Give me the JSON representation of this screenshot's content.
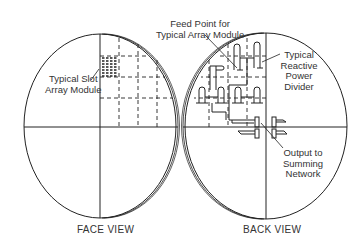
{
  "figure": {
    "face_view": {
      "caption": "FACE VIEW",
      "callout_slot_module": [
        "Typical Slot",
        "Array Module"
      ]
    },
    "back_view": {
      "caption": "BACK VIEW",
      "callout_feed_point": [
        "Feed Point for",
        "Typical Array Module"
      ],
      "callout_power_divider": [
        "Typical",
        "Reactive",
        "Power",
        "Divider"
      ],
      "callout_output": [
        "Output to",
        "Summing",
        "Network"
      ]
    },
    "colors": {
      "line": "#222222",
      "background": "#ffffff"
    }
  }
}
